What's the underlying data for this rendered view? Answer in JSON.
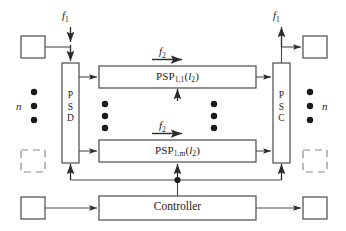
{
  "diagram": {
    "blocks": {
      "psd": {
        "name": "PSD",
        "letters": [
          "P",
          "S",
          "D"
        ]
      },
      "psc": {
        "name": "PSC",
        "letters": [
          "P",
          "S",
          "C"
        ]
      },
      "psp_top": {
        "prefix": "PSP",
        "subscript": "1,1",
        "arg_open": "(",
        "arg": "l",
        "arg_sub": "2",
        "arg_close": ")"
      },
      "psp_bottom": {
        "prefix": "PSP",
        "subscript": "1,m",
        "arg_open": "(",
        "arg": "l",
        "arg_sub": "2",
        "arg_close": ")"
      },
      "controller": {
        "name": "Controller"
      }
    },
    "signals": {
      "f1_in": {
        "symbol": "f",
        "subscript": "1"
      },
      "f1_out": {
        "symbol": "f",
        "subscript": "1"
      },
      "f2_top": {
        "symbol": "f",
        "subscript": "2"
      },
      "f2_bottom": {
        "symbol": "f",
        "subscript": "2"
      }
    },
    "multiplicity": {
      "left": "n",
      "right": "n"
    },
    "ellipsis": {
      "glyph": "●",
      "count": 3
    },
    "colors": {
      "stroke": "#3a3a3a",
      "text": "#1a1a1a",
      "dot": "#1a1a1a",
      "background": "#ffffff",
      "dashed_stroke": "#8a8a8a"
    }
  }
}
